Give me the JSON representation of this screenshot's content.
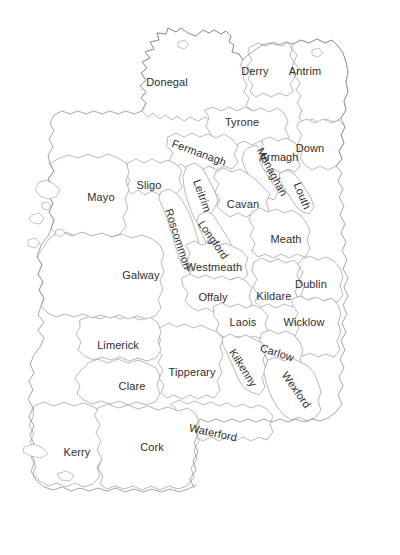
{
  "map": {
    "name": "ireland-counties-outline-map",
    "title": "Counties of Ireland",
    "background_color": "#ffffff",
    "border_color": "#9a9a9a",
    "coast_color": "#8f8f8f",
    "label_color": "#2e2e2e",
    "label_font_size_px": 11,
    "counties": [
      {
        "id": "donegal",
        "label": "Donegal",
        "x": 167,
        "y": 82,
        "rotate": 0
      },
      {
        "id": "derry",
        "label": "Derry",
        "x": 255,
        "y": 71,
        "rotate": 0
      },
      {
        "id": "antrim",
        "label": "Antrim",
        "x": 305,
        "y": 71,
        "rotate": 0
      },
      {
        "id": "tyrone",
        "label": "Tyrone",
        "x": 242,
        "y": 122,
        "rotate": 0
      },
      {
        "id": "down",
        "label": "Down",
        "x": 310,
        "y": 148,
        "rotate": 0
      },
      {
        "id": "fermanagh",
        "label": "Fermanagh",
        "x": 199,
        "y": 153,
        "rotate": 20
      },
      {
        "id": "armagh",
        "label": "Armagh",
        "x": 279,
        "y": 157,
        "rotate": 0
      },
      {
        "id": "monaghan",
        "label": "Monaghan",
        "x": 272,
        "y": 172,
        "rotate": 62
      },
      {
        "id": "louth",
        "label": "Louth",
        "x": 302,
        "y": 196,
        "rotate": 68
      },
      {
        "id": "sligo",
        "label": "Sligo",
        "x": 149,
        "y": 185,
        "rotate": 0
      },
      {
        "id": "leitrim",
        "label": "Leitrim",
        "x": 202,
        "y": 196,
        "rotate": 70
      },
      {
        "id": "cavan",
        "label": "Cavan",
        "x": 243,
        "y": 204,
        "rotate": 0
      },
      {
        "id": "mayo",
        "label": "Mayo",
        "x": 101,
        "y": 197,
        "rotate": 0
      },
      {
        "id": "roscommon",
        "label": "Roscommon",
        "x": 178,
        "y": 239,
        "rotate": 72
      },
      {
        "id": "longford",
        "label": "Longford",
        "x": 213,
        "y": 240,
        "rotate": 55
      },
      {
        "id": "meath",
        "label": "Meath",
        "x": 286,
        "y": 239,
        "rotate": 0
      },
      {
        "id": "galway",
        "label": "Galway",
        "x": 141,
        "y": 275,
        "rotate": 0
      },
      {
        "id": "westmeath",
        "label": "Westmeath",
        "x": 214,
        "y": 267,
        "rotate": 0
      },
      {
        "id": "offaly",
        "label": "Offaly",
        "x": 213,
        "y": 297,
        "rotate": 0
      },
      {
        "id": "kildare",
        "label": "Kildare",
        "x": 274,
        "y": 296,
        "rotate": 0
      },
      {
        "id": "dublin",
        "label": "Dublin",
        "x": 311,
        "y": 284,
        "rotate": 0
      },
      {
        "id": "laois",
        "label": "Laois",
        "x": 243,
        "y": 322,
        "rotate": 0
      },
      {
        "id": "wicklow",
        "label": "Wicklow",
        "x": 304,
        "y": 322,
        "rotate": 0
      },
      {
        "id": "limerick",
        "label": "Limerick",
        "x": 118,
        "y": 345,
        "rotate": 0
      },
      {
        "id": "tipperary",
        "label": "Tipperary",
        "x": 192,
        "y": 372,
        "rotate": 0
      },
      {
        "id": "kilkenny",
        "label": "Kilkenny",
        "x": 243,
        "y": 368,
        "rotate": 58
      },
      {
        "id": "carlow",
        "label": "Carlow",
        "x": 277,
        "y": 353,
        "rotate": 18
      },
      {
        "id": "clare",
        "label": "Clare",
        "x": 132,
        "y": 386,
        "rotate": 0
      },
      {
        "id": "wexford",
        "label": "Wexford",
        "x": 296,
        "y": 390,
        "rotate": 55
      },
      {
        "id": "waterford",
        "label": "Waterford",
        "x": 213,
        "y": 433,
        "rotate": 12
      },
      {
        "id": "kerry",
        "label": "Kerry",
        "x": 77,
        "y": 452,
        "rotate": 0
      },
      {
        "id": "cork",
        "label": "Cork",
        "x": 152,
        "y": 447,
        "rotate": 0
      }
    ]
  }
}
